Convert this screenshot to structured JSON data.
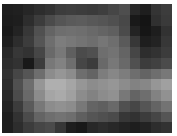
{
  "image": {
    "description": "Low-resolution pixelated grayscale image",
    "grid": {
      "cols": 16,
      "rows": 12
    },
    "pixels": [
      [
        30,
        32,
        38,
        45,
        50,
        60,
        62,
        60,
        58,
        62,
        70,
        78,
        40,
        30,
        52,
        60
      ],
      [
        28,
        30,
        45,
        60,
        75,
        85,
        90,
        92,
        88,
        85,
        80,
        72,
        25,
        20,
        48,
        58
      ],
      [
        25,
        35,
        55,
        80,
        100,
        110,
        112,
        110,
        105,
        100,
        95,
        75,
        35,
        22,
        30,
        50
      ],
      [
        30,
        45,
        60,
        85,
        110,
        125,
        120,
        115,
        110,
        118,
        110,
        90,
        55,
        30,
        35,
        55
      ],
      [
        40,
        55,
        50,
        70,
        105,
        120,
        95,
        75,
        80,
        110,
        115,
        100,
        70,
        45,
        50,
        60
      ],
      [
        45,
        50,
        25,
        60,
        120,
        130,
        110,
        70,
        60,
        105,
        120,
        105,
        80,
        60,
        65,
        75
      ],
      [
        50,
        70,
        85,
        110,
        140,
        150,
        140,
        110,
        100,
        125,
        135,
        125,
        110,
        100,
        110,
        120
      ],
      [
        45,
        80,
        110,
        150,
        175,
        175,
        165,
        150,
        140,
        145,
        150,
        140,
        130,
        135,
        150,
        160
      ],
      [
        40,
        75,
        105,
        140,
        165,
        170,
        160,
        140,
        130,
        140,
        145,
        120,
        100,
        110,
        130,
        145
      ],
      [
        35,
        60,
        90,
        120,
        140,
        145,
        140,
        120,
        100,
        95,
        105,
        80,
        70,
        85,
        100,
        115
      ],
      [
        30,
        50,
        75,
        100,
        110,
        115,
        110,
        95,
        85,
        80,
        75,
        55,
        50,
        60,
        70,
        85
      ],
      [
        30,
        45,
        60,
        70,
        75,
        55,
        30,
        25,
        40,
        45,
        40,
        35,
        30,
        35,
        45,
        50
      ]
    ]
  }
}
